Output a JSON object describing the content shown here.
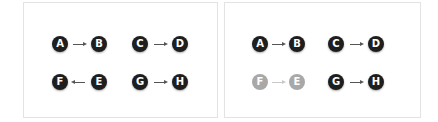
{
  "colors": {
    "node": "#1e1e1e",
    "node_faded": "#a8a8a8",
    "arrow": "#555555",
    "arrow_faded": "#c8c8c8",
    "border": "#e3e3e3"
  },
  "panels": [
    {
      "name": "left-panel",
      "left": 23,
      "width": 195,
      "nodes": [
        {
          "label": "A",
          "x": 52,
          "y": 36,
          "faded": false
        },
        {
          "label": "B",
          "x": 91,
          "y": 36,
          "faded": false
        },
        {
          "label": "C",
          "x": 132,
          "y": 36,
          "faded": false
        },
        {
          "label": "D",
          "x": 172,
          "y": 36,
          "faded": false
        },
        {
          "label": "F",
          "x": 52,
          "y": 74,
          "faded": false
        },
        {
          "label": "E",
          "x": 91,
          "y": 74,
          "faded": false
        },
        {
          "label": "G",
          "x": 132,
          "y": 74,
          "faded": false
        },
        {
          "label": "H",
          "x": 172,
          "y": 74,
          "faded": false
        }
      ],
      "edges": [
        {
          "from": "A",
          "to": "B",
          "dir": "right",
          "x": 73,
          "y": 44,
          "faded": false
        },
        {
          "from": "C",
          "to": "D",
          "dir": "right",
          "x": 154,
          "y": 44,
          "faded": false
        },
        {
          "from": "E",
          "to": "F",
          "dir": "left",
          "x": 73,
          "y": 82,
          "faded": false
        },
        {
          "from": "G",
          "to": "H",
          "dir": "right",
          "x": 154,
          "y": 82,
          "faded": false
        }
      ]
    },
    {
      "name": "right-panel",
      "left": 224,
      "width": 197,
      "nodes": [
        {
          "label": "A",
          "x": 252,
          "y": 36,
          "faded": false
        },
        {
          "label": "B",
          "x": 289,
          "y": 36,
          "faded": false
        },
        {
          "label": "C",
          "x": 328,
          "y": 36,
          "faded": false
        },
        {
          "label": "D",
          "x": 368,
          "y": 36,
          "faded": false
        },
        {
          "label": "F",
          "x": 252,
          "y": 74,
          "faded": true
        },
        {
          "label": "E",
          "x": 289,
          "y": 74,
          "faded": true
        },
        {
          "label": "G",
          "x": 328,
          "y": 74,
          "faded": false
        },
        {
          "label": "H",
          "x": 368,
          "y": 74,
          "faded": false
        }
      ],
      "edges": [
        {
          "from": "A",
          "to": "B",
          "dir": "right",
          "x": 272,
          "y": 44,
          "faded": false
        },
        {
          "from": "C",
          "to": "D",
          "dir": "right",
          "x": 350,
          "y": 44,
          "faded": false
        },
        {
          "from": "F",
          "to": "E",
          "dir": "right",
          "x": 272,
          "y": 82,
          "faded": true
        },
        {
          "from": "G",
          "to": "H",
          "dir": "right",
          "x": 350,
          "y": 82,
          "faded": false
        }
      ]
    }
  ]
}
